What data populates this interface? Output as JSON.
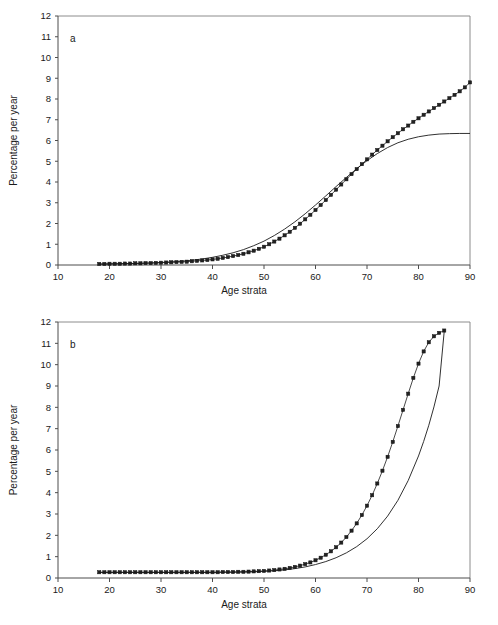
{
  "figure": {
    "panel_count": 2
  },
  "panels": [
    {
      "letter": "a",
      "xlabel": "Age strata",
      "ylabel": "Percentage per year",
      "xticks": [
        "10",
        "20",
        "30",
        "40",
        "50",
        "60",
        "70",
        "80",
        "90"
      ],
      "yticks": [
        "0",
        "1",
        "2",
        "3",
        "4",
        "5",
        "6",
        "7",
        "8",
        "9",
        "10",
        "11",
        "12"
      ]
    },
    {
      "letter": "b",
      "xlabel": "Age strata",
      "ylabel": "Percentage per year",
      "xticks": [
        "10",
        "20",
        "30",
        "40",
        "50",
        "60",
        "70",
        "80",
        "90"
      ],
      "yticks": [
        "0",
        "1",
        "2",
        "3",
        "4",
        "5",
        "6",
        "7",
        "8",
        "9",
        "10",
        "11",
        "12"
      ]
    }
  ],
  "chart_data": [
    {
      "type": "line",
      "title": "",
      "panel": "a",
      "xlabel": "Age strata",
      "ylabel": "Percentage per year",
      "xlim": [
        10,
        90
      ],
      "ylim": [
        0,
        12
      ],
      "xticks": [
        10,
        20,
        30,
        40,
        50,
        60,
        70,
        80,
        90
      ],
      "yticks": [
        0,
        1,
        2,
        3,
        4,
        5,
        6,
        7,
        8,
        9,
        10,
        11,
        12
      ],
      "grid": false,
      "legend": "none",
      "series": [
        {
          "name": "Observed (squares)",
          "marker": "square",
          "x": [
            18,
            19,
            20,
            21,
            22,
            23,
            24,
            25,
            26,
            27,
            28,
            29,
            30,
            31,
            32,
            33,
            34,
            35,
            36,
            37,
            38,
            39,
            40,
            41,
            42,
            43,
            44,
            45,
            46,
            47,
            48,
            49,
            50,
            51,
            52,
            53,
            54,
            55,
            56,
            57,
            58,
            59,
            60,
            61,
            62,
            63,
            64,
            65,
            66,
            67,
            68,
            69,
            70,
            71,
            72,
            73,
            74,
            75,
            76,
            77,
            78,
            79,
            80,
            81,
            82,
            83,
            84,
            85,
            86,
            87,
            88,
            89,
            90
          ],
          "y": [
            0.05,
            0.05,
            0.06,
            0.06,
            0.06,
            0.07,
            0.07,
            0.08,
            0.08,
            0.09,
            0.09,
            0.1,
            0.11,
            0.12,
            0.13,
            0.14,
            0.15,
            0.16,
            0.18,
            0.2,
            0.22,
            0.24,
            0.27,
            0.3,
            0.34,
            0.38,
            0.43,
            0.48,
            0.54,
            0.61,
            0.69,
            0.78,
            0.88,
            1.0,
            1.13,
            1.27,
            1.43,
            1.6,
            1.79,
            1.99,
            2.2,
            2.42,
            2.65,
            2.89,
            3.13,
            3.38,
            3.63,
            3.88,
            4.13,
            4.38,
            4.62,
            4.86,
            5.09,
            5.32,
            5.54,
            5.75,
            5.96,
            6.16,
            6.35,
            6.54,
            6.72,
            6.9,
            7.07,
            7.24,
            7.4,
            7.56,
            7.72,
            7.88,
            8.04,
            8.2,
            8.37,
            8.56,
            8.8
          ]
        },
        {
          "name": "Fitted (smooth line)",
          "marker": "none",
          "x": [
            18,
            20,
            22,
            24,
            26,
            28,
            30,
            32,
            34,
            36,
            38,
            40,
            42,
            44,
            46,
            48,
            50,
            52,
            54,
            56,
            58,
            60,
            62,
            64,
            66,
            68,
            70,
            72,
            74,
            76,
            78,
            80,
            82,
            84,
            86,
            88,
            90
          ],
          "y": [
            0.04,
            0.05,
            0.06,
            0.07,
            0.08,
            0.1,
            0.12,
            0.15,
            0.18,
            0.23,
            0.29,
            0.37,
            0.47,
            0.59,
            0.74,
            0.93,
            1.15,
            1.42,
            1.73,
            2.08,
            2.47,
            2.89,
            3.33,
            3.78,
            4.22,
            4.64,
            5.03,
            5.37,
            5.66,
            5.89,
            6.06,
            6.18,
            6.26,
            6.31,
            6.33,
            6.34,
            6.34
          ]
        }
      ]
    },
    {
      "type": "line",
      "title": "",
      "panel": "b",
      "xlabel": "Age strata",
      "ylabel": "Percentage per year",
      "xlim": [
        10,
        90
      ],
      "ylim": [
        0,
        12
      ],
      "xticks": [
        10,
        20,
        30,
        40,
        50,
        60,
        70,
        80,
        90
      ],
      "yticks": [
        0,
        1,
        2,
        3,
        4,
        5,
        6,
        7,
        8,
        9,
        10,
        11,
        12
      ],
      "grid": false,
      "legend": "none",
      "series": [
        {
          "name": "Observed (squares)",
          "marker": "square",
          "x": [
            18,
            19,
            20,
            21,
            22,
            23,
            24,
            25,
            26,
            27,
            28,
            29,
            30,
            31,
            32,
            33,
            34,
            35,
            36,
            37,
            38,
            39,
            40,
            41,
            42,
            43,
            44,
            45,
            46,
            47,
            48,
            49,
            50,
            51,
            52,
            53,
            54,
            55,
            56,
            57,
            58,
            59,
            60,
            61,
            62,
            63,
            64,
            65,
            66,
            67,
            68,
            69,
            70,
            71,
            72,
            73,
            74,
            75,
            76,
            77,
            78,
            79,
            80,
            81,
            82,
            83,
            84,
            85
          ],
          "y": [
            0.27,
            0.27,
            0.27,
            0.27,
            0.27,
            0.27,
            0.27,
            0.27,
            0.27,
            0.27,
            0.27,
            0.27,
            0.27,
            0.27,
            0.27,
            0.27,
            0.27,
            0.27,
            0.27,
            0.27,
            0.27,
            0.27,
            0.27,
            0.27,
            0.28,
            0.28,
            0.28,
            0.29,
            0.29,
            0.3,
            0.31,
            0.32,
            0.33,
            0.35,
            0.37,
            0.4,
            0.43,
            0.47,
            0.52,
            0.58,
            0.65,
            0.73,
            0.83,
            0.95,
            1.09,
            1.25,
            1.44,
            1.66,
            1.92,
            2.22,
            2.56,
            2.95,
            3.39,
            3.88,
            4.43,
            5.03,
            5.68,
            6.38,
            7.12,
            7.88,
            8.64,
            9.38,
            10.05,
            10.62,
            11.05,
            11.33,
            11.49,
            11.6
          ]
        },
        {
          "name": "Fitted (smooth line)",
          "marker": "none",
          "x": [
            18,
            20,
            22,
            24,
            26,
            28,
            30,
            32,
            34,
            36,
            38,
            40,
            42,
            44,
            46,
            48,
            50,
            52,
            54,
            56,
            58,
            60,
            62,
            64,
            66,
            68,
            70,
            72,
            74,
            76,
            78,
            80,
            81,
            82,
            83,
            84,
            85
          ],
          "y": [
            0.26,
            0.26,
            0.26,
            0.26,
            0.26,
            0.26,
            0.26,
            0.26,
            0.26,
            0.26,
            0.26,
            0.26,
            0.27,
            0.27,
            0.28,
            0.29,
            0.31,
            0.34,
            0.38,
            0.44,
            0.52,
            0.63,
            0.77,
            0.95,
            1.18,
            1.47,
            1.84,
            2.31,
            2.9,
            3.64,
            4.57,
            5.72,
            6.4,
            7.16,
            8.02,
            9.0,
            11.58
          ]
        }
      ]
    }
  ]
}
